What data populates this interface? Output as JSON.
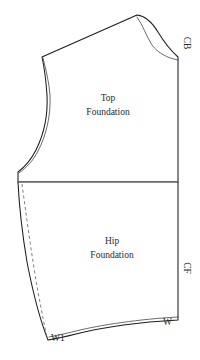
{
  "document": {
    "type": "sewing-pattern-draft",
    "background_color": "#ffffff",
    "line_color": "#1c1c1c",
    "guide_color": "#8a8a8a"
  },
  "pieces": {
    "top": {
      "label_line1": "Top",
      "label_line2": "Foundation"
    },
    "hip": {
      "label_line1": "Hip",
      "label_line2": "Foundation"
    }
  },
  "markings": {
    "center_back": "CB",
    "center_front": "CF",
    "waist_point_side": "W1",
    "waist_point_center": "W"
  }
}
